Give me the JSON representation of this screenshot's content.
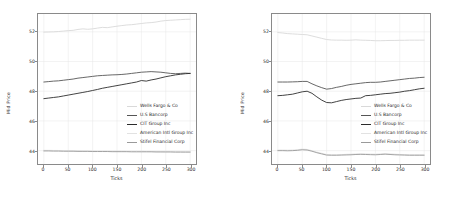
{
  "figure": {
    "panels": [
      {
        "id": "left",
        "xlabel": "Ticks",
        "ylabel": "Mid Price",
        "xticks": [
          "0",
          "50",
          "100",
          "150",
          "200",
          "250",
          "300"
        ],
        "yticks": [
          "44",
          "46",
          "48",
          "50",
          "52"
        ]
      },
      {
        "id": "right",
        "xlabel": "Ticks",
        "ylabel": "Mid Price",
        "xticks": [
          "0",
          "50",
          "100",
          "150",
          "200",
          "250",
          "300"
        ],
        "yticks": [
          "44",
          "46",
          "48",
          "50",
          "52"
        ]
      }
    ],
    "legend": {
      "entries": [
        {
          "label": "Wells Fargo & Co",
          "color": "#d9d9d9"
        },
        {
          "label": "U.S Bancorp",
          "color": "#555555"
        },
        {
          "label": "CIT Group Inc",
          "color": "#2b2b2b"
        },
        {
          "label": "American Intl Group Inc",
          "color": "#e2e2e2"
        },
        {
          "label": "Stifel Financial Corp",
          "color": "#9a9a9a"
        }
      ]
    }
  },
  "chart_data": [
    {
      "type": "line",
      "panel": "left",
      "title": "",
      "xlabel": "Ticks",
      "ylabel": "Mid Price",
      "xlim": [
        -12,
        312
      ],
      "ylim": [
        43.1,
        53.2
      ],
      "xticks": [
        0,
        50,
        100,
        150,
        200,
        250,
        300
      ],
      "yticks": [
        44,
        46,
        48,
        50,
        52
      ],
      "grid": true,
      "legend_position": "center-right",
      "x": [
        0,
        10,
        20,
        30,
        40,
        50,
        60,
        70,
        80,
        90,
        100,
        110,
        120,
        130,
        140,
        150,
        160,
        170,
        180,
        190,
        200,
        210,
        220,
        230,
        240,
        250,
        260,
        270,
        280,
        290,
        300
      ],
      "series": [
        {
          "name": "Wells Fargo & Co",
          "color": "#d9d9d9",
          "values": [
            51.98,
            51.99,
            52.0,
            52.02,
            52.05,
            52.08,
            52.1,
            52.16,
            52.2,
            52.17,
            52.2,
            52.25,
            52.3,
            52.28,
            52.33,
            52.38,
            52.42,
            52.46,
            52.48,
            52.52,
            52.56,
            52.6,
            52.62,
            52.66,
            52.72,
            52.76,
            52.78,
            52.8,
            52.82,
            52.84,
            52.85
          ]
        },
        {
          "name": "U.S Bancorp",
          "color": "#555555",
          "values": [
            48.62,
            48.65,
            48.68,
            48.7,
            48.74,
            48.78,
            48.82,
            48.88,
            48.92,
            48.96,
            49.0,
            49.04,
            49.06,
            49.08,
            49.1,
            49.11,
            49.13,
            49.16,
            49.2,
            49.24,
            49.28,
            49.3,
            49.32,
            49.3,
            49.28,
            49.24,
            49.2,
            49.18,
            49.2,
            49.22,
            49.2
          ]
        },
        {
          "name": "CIT Group Inc",
          "color": "#2b2b2b",
          "values": [
            47.5,
            47.54,
            47.58,
            47.62,
            47.68,
            47.74,
            47.8,
            47.86,
            47.92,
            47.98,
            48.05,
            48.12,
            48.2,
            48.26,
            48.32,
            48.38,
            48.44,
            48.5,
            48.56,
            48.62,
            48.72,
            48.68,
            48.76,
            48.82,
            48.9,
            48.98,
            49.04,
            49.1,
            49.14,
            49.18,
            49.2
          ]
        },
        {
          "name": "American Intl Group Inc",
          "color": "#e2e2e2",
          "values": [
            44.02,
            44.02,
            44.01,
            44.01,
            44.0,
            44.0,
            43.99,
            43.99,
            43.98,
            43.98,
            43.98,
            43.97,
            43.97,
            43.97,
            43.96,
            43.96,
            43.96,
            43.95,
            43.95,
            43.95,
            43.95,
            43.94,
            43.94,
            43.94,
            43.94,
            43.93,
            43.93,
            43.93,
            43.93,
            43.92,
            43.92
          ]
        },
        {
          "name": "Stifel Financial Corp",
          "color": "#9a9a9a",
          "values": [
            43.98,
            43.98,
            43.97,
            43.97,
            43.96,
            43.96,
            43.96,
            43.95,
            43.95,
            43.95,
            43.94,
            43.94,
            43.94,
            43.94,
            43.93,
            43.93,
            43.93,
            43.93,
            43.92,
            43.92,
            43.92,
            43.92,
            43.92,
            43.91,
            43.91,
            43.91,
            43.91,
            43.9,
            43.9,
            43.9,
            43.9
          ]
        }
      ]
    },
    {
      "type": "line",
      "panel": "right",
      "title": "",
      "xlabel": "Ticks",
      "ylabel": "Mid Price",
      "xlim": [
        -12,
        312
      ],
      "ylim": [
        43.1,
        53.2
      ],
      "xticks": [
        0,
        50,
        100,
        150,
        200,
        250,
        300
      ],
      "yticks": [
        44,
        46,
        48,
        50,
        52
      ],
      "grid": true,
      "legend_position": "center-right",
      "x": [
        0,
        10,
        20,
        30,
        40,
        50,
        60,
        70,
        80,
        90,
        100,
        110,
        120,
        130,
        140,
        150,
        160,
        170,
        180,
        190,
        200,
        210,
        220,
        230,
        240,
        250,
        260,
        270,
        280,
        290,
        300
      ],
      "series": [
        {
          "name": "Wells Fargo & Co",
          "color": "#d9d9d9",
          "values": [
            51.95,
            51.92,
            51.88,
            51.86,
            51.84,
            51.82,
            51.8,
            51.72,
            51.64,
            51.56,
            51.48,
            51.45,
            51.44,
            51.44,
            51.43,
            51.44,
            51.46,
            51.44,
            51.43,
            51.42,
            51.4,
            51.4,
            51.41,
            51.42,
            51.42,
            51.43,
            51.43,
            51.44,
            51.44,
            51.44,
            51.44
          ]
        },
        {
          "name": "U.S Bancorp",
          "color": "#555555",
          "values": [
            48.62,
            48.62,
            48.62,
            48.63,
            48.64,
            48.66,
            48.66,
            48.5,
            48.36,
            48.24,
            48.14,
            48.18,
            48.26,
            48.32,
            48.4,
            48.46,
            48.5,
            48.54,
            48.58,
            48.6,
            48.6,
            48.62,
            48.66,
            48.7,
            48.74,
            48.78,
            48.82,
            48.86,
            48.88,
            48.92,
            48.94
          ]
        },
        {
          "name": "CIT Group Inc",
          "color": "#2b2b2b",
          "values": [
            47.7,
            47.72,
            47.76,
            47.8,
            47.88,
            47.96,
            48.0,
            47.86,
            47.62,
            47.4,
            47.24,
            47.22,
            47.3,
            47.38,
            47.44,
            47.48,
            47.52,
            47.54,
            47.7,
            47.72,
            47.76,
            47.8,
            47.84,
            47.86,
            47.9,
            47.94,
            48.0,
            48.04,
            48.1,
            48.16,
            48.2
          ]
        },
        {
          "name": "American Intl Group Inc",
          "color": "#e2e2e2",
          "values": [
            44.04,
            44.04,
            44.03,
            44.04,
            44.06,
            44.1,
            44.08,
            44.0,
            43.9,
            43.82,
            43.74,
            43.72,
            43.72,
            43.73,
            43.75,
            43.76,
            43.78,
            43.79,
            43.78,
            43.77,
            43.76,
            43.78,
            43.8,
            43.78,
            43.76,
            43.74,
            43.73,
            43.72,
            43.72,
            43.72,
            43.72
          ]
        },
        {
          "name": "Stifel Financial Corp",
          "color": "#9a9a9a",
          "values": [
            44.0,
            44.0,
            43.99,
            44.0,
            44.02,
            44.06,
            44.04,
            43.96,
            43.86,
            43.78,
            43.7,
            43.69,
            43.69,
            43.7,
            43.71,
            43.72,
            43.74,
            43.75,
            43.74,
            43.73,
            43.72,
            43.74,
            43.76,
            43.74,
            43.72,
            43.71,
            43.7,
            43.69,
            43.69,
            43.69,
            43.69
          ]
        }
      ]
    }
  ]
}
